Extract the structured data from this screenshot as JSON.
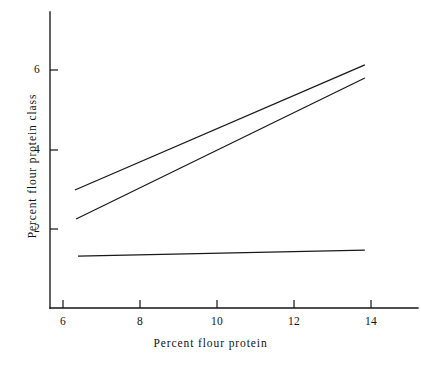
{
  "chart_data": {
    "type": "line",
    "title": "",
    "subtitle": "",
    "xlabel": "Percent flour protein",
    "ylabel": "Percent flour protein class",
    "xlim": [
      5.3,
      15.1
    ],
    "ylim": [
      0.35,
      7.45
    ],
    "xticks": [
      6,
      8,
      10,
      12,
      14
    ],
    "xticklabels": [
      "6",
      "8",
      "10",
      "12",
      "14"
    ],
    "yticks": [
      2,
      4,
      6
    ],
    "yticklabels": [
      "2",
      "4",
      "6"
    ],
    "grid": false,
    "legend": null,
    "legend_position": "none",
    "annotations": [],
    "series": [
      {
        "name": "upper-line",
        "x": [
          6.31,
          13.84
        ],
        "y": [
          2.98,
          6.13
        ]
      },
      {
        "name": "middle-line",
        "x": [
          6.34,
          13.84
        ],
        "y": [
          2.25,
          5.8
        ]
      },
      {
        "name": "lower-flat-line",
        "x": [
          6.39,
          13.84
        ],
        "y": [
          1.32,
          1.47
        ]
      }
    ]
  },
  "figure": {
    "background_color": "#ffffff",
    "line_color": "#191919",
    "axis_color": "#151515"
  }
}
